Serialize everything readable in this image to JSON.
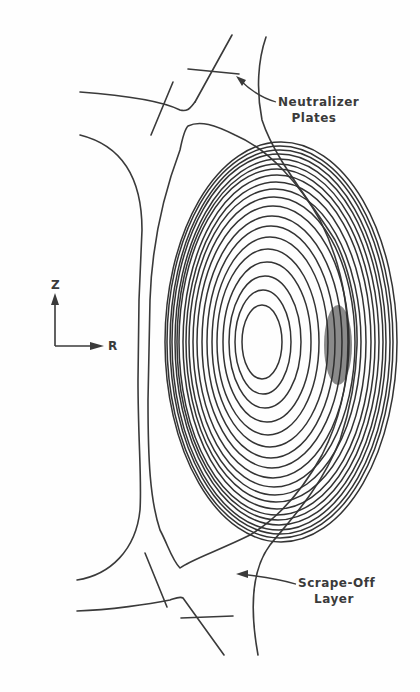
{
  "figure": {
    "background_color": "#fefefe",
    "line_color": "#3a3a3a",
    "labels": {
      "neutralizer_line1": "Neutralizer",
      "neutralizer_line2": "Plates",
      "scrape_off_line1": "Scrape-Off",
      "scrape_off_line2": "Layer"
    },
    "axes": {
      "vertical": "Z",
      "horizontal": "R"
    },
    "annotations": [
      {
        "text": "Neutralizer Plates",
        "points_to": "upper divertor plate"
      },
      {
        "text": "Scrape-Off Layer",
        "points_to": "region outside separatrix"
      }
    ],
    "flux_surfaces": {
      "count": 22,
      "magnetic_axis": {
        "x": 262,
        "y": 342
      }
    }
  }
}
